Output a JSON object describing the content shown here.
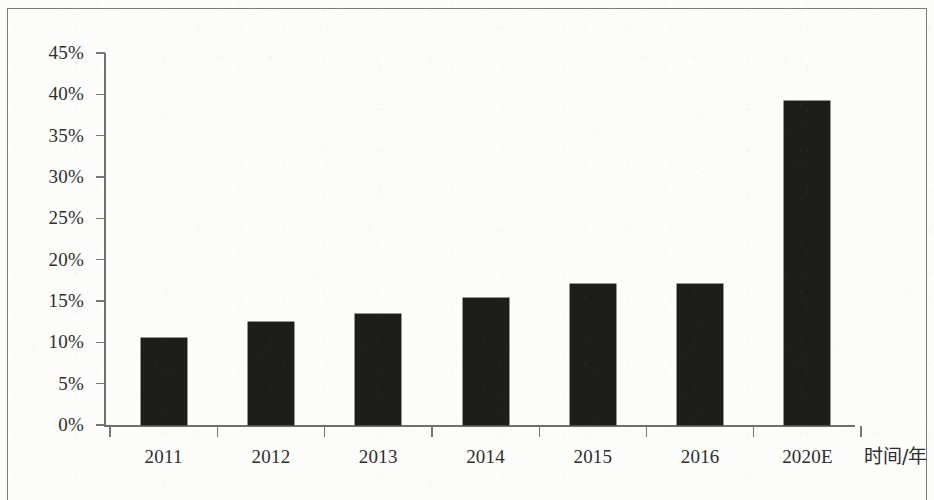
{
  "chart_data": {
    "type": "bar",
    "title": "",
    "subtitle": "",
    "xlabel": "时间/年",
    "ylabel": "",
    "categories": [
      "2011",
      "2012",
      "2013",
      "2014",
      "2015",
      "2016",
      "2020E"
    ],
    "values": [
      10.5,
      12.4,
      13.4,
      15.4,
      17.0,
      17.1,
      39.2
    ],
    "value_unit": "%",
    "ylim": [
      0,
      45
    ],
    "ytick_labels": [
      "0%",
      "5%",
      "10%",
      "15%",
      "20%",
      "25%",
      "30%",
      "35%",
      "40%",
      "45%"
    ],
    "ytick_values": [
      0,
      5,
      10,
      15,
      20,
      25,
      30,
      35,
      40,
      45
    ],
    "grid": false,
    "legend": null,
    "legend_position": "none",
    "series": [
      {
        "name": "",
        "values": [
          10.5,
          12.4,
          13.4,
          15.4,
          17.0,
          17.1,
          39.2
        ]
      }
    ],
    "bar_color": "#1d1d1b",
    "axis_color": "#6f6f6d",
    "background_color": "#fcfcfb",
    "annotations": []
  },
  "figure": {
    "frame_visible": true,
    "frame_color": "#7c7c7a"
  }
}
